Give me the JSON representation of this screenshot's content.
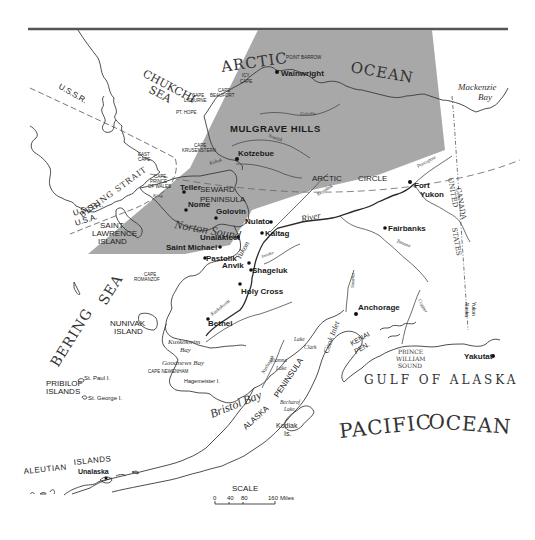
{
  "map": {
    "shaded_region_color": "#a8a8a8",
    "oceans_seas": {
      "arctic": "ARCTIC",
      "ocean": "OCEAN",
      "chukchi": "CHUKCHI",
      "sea1": "SEA",
      "bering": "BERING",
      "sea2": "SEA",
      "pacific": "PACIFIC",
      "pacific_ocean": "OCEAN",
      "gulf_of_alaska": "GULF OF ALASKA",
      "norton_sound": "Norton Sound",
      "bristol_bay": "Bristol Bay",
      "kuskokwim_bay_1": "Kuskokwim",
      "kuskokwim_bay_2": "Bay",
      "goodnews_bay": "Goodnews Bay",
      "mackenzie_1": "Mackenzie",
      "mackenzie_2": "Bay",
      "prince_william_1": "PRINCE",
      "prince_william_2": "WILLIAM",
      "prince_william_3": "SOUND",
      "bering_strait": "BERING STRAIT",
      "cook_inlet": "Cook Inlet"
    },
    "regions": {
      "ussr": "U.S.S.R.",
      "ussr2": "U.S.S.R.",
      "usa": "U.S.A.",
      "canada": "CANADA",
      "united": "UNITED",
      "states": "STATES",
      "yukon_alaska_1": "Yukon",
      "yukon_alaska_2": "Alaska",
      "mulgrave_hills": "MULGRAVE HILLS",
      "seward_1": "SEWARD",
      "seward_2": "PENINSULA",
      "alaska_pen_1": "ALASKA",
      "alaska_pen_2": "PENINSULA",
      "kenai_1": "KENAI",
      "kenai_2": "PEN.",
      "arctic_circle_1": "ARCTIC",
      "arctic_circle_2": "CIRCLE"
    },
    "islands": {
      "saint_lawrence_1": "SAINT",
      "saint_lawrence_2": "LAWRENCE",
      "saint_lawrence_3": "ISLAND",
      "nunivak_1": "NUNIVAK",
      "nunivak_2": "ISLAND",
      "pribilof_1": "PRIBILOF",
      "pribilof_2": "ISLANDS",
      "st_paul": "St. Paul I.",
      "st_george": "St. George I.",
      "aleutian_1": "ALEUTIAN",
      "aleutian_2": "ISLANDS",
      "kodiak_1": "Kodiak",
      "kodiak_2": "Is.",
      "hagemeister": "Hagemeister I."
    },
    "capes": {
      "icy_1": "ICY",
      "icy_2": "CAPE",
      "point_barrow": "POINT BARROW",
      "lisburne_1": "CAPE",
      "lisburne_2": "LISBURNE",
      "beaufort_1": "CAPE",
      "beaufort_2": "BEAUFORT",
      "pt_hope": "PT. HOPE",
      "krusenstern_1": "CAPE",
      "krusenstern_2": "KRUSENSTERN",
      "east_1": "EAST",
      "east_2": "CAPE",
      "pow_1": "CAPE",
      "pow_2": "PRINCE",
      "pow_3": "OF WALES",
      "romanzof_1": "CAPE",
      "romanzof_2": "ROMANZOF",
      "newenham": "CAPE NEWENHAM"
    },
    "cities": [
      {
        "name": "Wainwright"
      },
      {
        "name": "Kotzebue"
      },
      {
        "name": "Teller"
      },
      {
        "name": "Nome"
      },
      {
        "name": "Golovin"
      },
      {
        "name": "Nulato"
      },
      {
        "name": "Kaltag"
      },
      {
        "name": "Unalakleet"
      },
      {
        "name": "Saint Michael"
      },
      {
        "name": "Pastolik"
      },
      {
        "name": "Anvik"
      },
      {
        "name": "Shageluk"
      },
      {
        "name": "Holy Cross"
      },
      {
        "name": "Bethel"
      },
      {
        "name": "Fort"
      },
      {
        "name": "Yukon"
      },
      {
        "name": "Fairbanks"
      },
      {
        "name": "Anchorage"
      },
      {
        "name": "Yakutat"
      },
      {
        "name": "Unalaska"
      }
    ],
    "rivers": {
      "yukon": "Yukon",
      "river": "River",
      "kobuk": "Kobuk",
      "noatak": "Noatak",
      "colville": "Colville",
      "koyukuk": "Koyukuk",
      "porcupine": "Porcupine",
      "tanana": "Tanana",
      "kuskokwim": "Kuskokwim",
      "copper": "Copper",
      "susitna": "Susitna",
      "nushagak": "Nushagak",
      "innoko": "Innoko",
      "king": "King",
      "r": "R."
    },
    "lakes": {
      "clark_1": "Lake",
      "clark_2": "Clark",
      "iliamna_1": "Iliamna",
      "iliamna_2": "Lake",
      "becharof_1": "Becharof",
      "becharof_2": "Lake"
    },
    "scale": {
      "title": "SCALE",
      "t0": "0",
      "t40": "40",
      "t80": "80",
      "t160": "160",
      "unit": "Miles"
    }
  }
}
